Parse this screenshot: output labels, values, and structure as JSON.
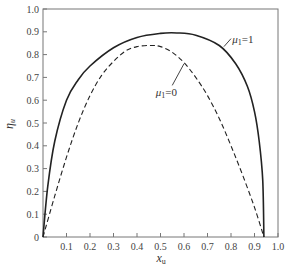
{
  "chart_data": {
    "type": "line",
    "title": "",
    "xlabel": "x_u",
    "ylabel": "η_u",
    "xlim": [
      0,
      1.0
    ],
    "ylim": [
      0,
      1.0
    ],
    "grid": false,
    "xticks": [
      "0.1",
      "0.2",
      "0.3",
      "0.4",
      "0.5",
      "0.6",
      "0.7",
      "0.8",
      "0.9",
      "1.0"
    ],
    "yticks": [
      "0",
      "0.1",
      "0.2",
      "0.3",
      "0.4",
      "0.5",
      "0.6",
      "0.7",
      "0.8",
      "0.9",
      "1.0"
    ],
    "series": [
      {
        "name": "μ1=1",
        "style": "solid",
        "x": [
          0,
          0.02,
          0.05,
          0.1,
          0.15,
          0.2,
          0.3,
          0.4,
          0.5,
          0.57,
          0.65,
          0.75,
          0.82,
          0.87,
          0.9,
          0.92,
          0.935,
          0.94
        ],
        "y": [
          0,
          0.22,
          0.42,
          0.6,
          0.69,
          0.75,
          0.83,
          0.875,
          0.893,
          0.895,
          0.885,
          0.84,
          0.76,
          0.66,
          0.55,
          0.42,
          0.25,
          0
        ]
      },
      {
        "name": "μ1=0",
        "style": "dashed",
        "x": [
          0,
          0.05,
          0.1,
          0.15,
          0.2,
          0.25,
          0.3,
          0.35,
          0.4,
          0.46,
          0.5,
          0.55,
          0.6,
          0.65,
          0.7,
          0.75,
          0.8,
          0.85,
          0.9,
          0.94
        ],
        "y": [
          0,
          0.18,
          0.35,
          0.5,
          0.62,
          0.71,
          0.77,
          0.815,
          0.835,
          0.84,
          0.835,
          0.81,
          0.765,
          0.7,
          0.62,
          0.52,
          0.4,
          0.27,
          0.13,
          0
        ]
      }
    ],
    "annotations": [
      "μ1=1",
      "μ1=0"
    ]
  },
  "labels": {
    "xlabel": "x",
    "xlabel_sub": "u",
    "ylabel": "η",
    "ylabel_sub": "u",
    "ann_solid": "μ",
    "ann_solid_rest": "=1",
    "ann_dashed": "μ",
    "ann_dashed_rest": "=0",
    "sub1": "1"
  }
}
